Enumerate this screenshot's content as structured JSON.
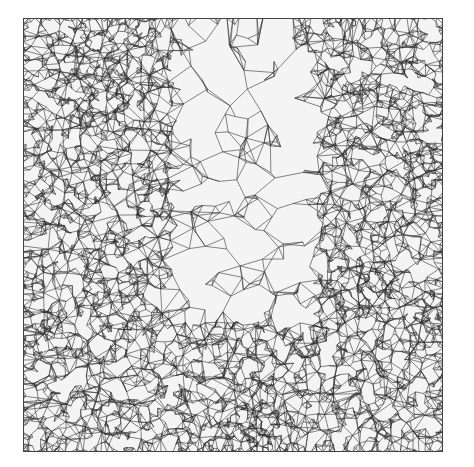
{
  "figure": {
    "type": "triangular-mesh",
    "colors": {
      "background": "#ffffff",
      "edge": "#333333",
      "fill": "#f4f4f4"
    },
    "domain": {
      "x": 23,
      "y": 18,
      "width": 420,
      "height": 434
    },
    "coarse_region": {
      "x0": 0.36,
      "x1": 0.7,
      "y0": 0.0,
      "y1": 0.7
    },
    "dense_spots": [
      {
        "cx": 0.18,
        "cy": 0.15,
        "r": 0.15
      },
      {
        "cx": 0.95,
        "cy": 0.35,
        "r": 0.1
      },
      {
        "cx": 0.8,
        "cy": 0.62,
        "r": 0.1
      },
      {
        "cx": 0.02,
        "cy": 0.72,
        "r": 0.08
      },
      {
        "cx": 0.55,
        "cy": 0.97,
        "r": 0.14
      },
      {
        "cx": 0.7,
        "cy": 0.02,
        "r": 0.08
      },
      {
        "cx": 0.98,
        "cy": 0.7,
        "r": 0.08
      }
    ]
  }
}
